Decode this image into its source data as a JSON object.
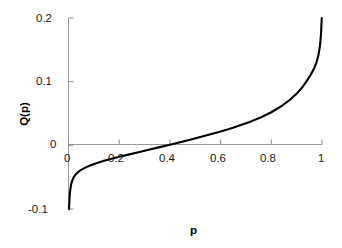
{
  "chart_data": {
    "type": "line",
    "title": "",
    "subtitle": "",
    "xlabel": "p",
    "ylabel": "Q(p)",
    "xlim": [
      0,
      1
    ],
    "ylim": [
      -0.1,
      0.2
    ],
    "grid": false,
    "legend": null,
    "x_ticks": [
      {
        "value": 0,
        "label": "0"
      },
      {
        "value": 0.2,
        "label": "0.2"
      },
      {
        "value": 0.4,
        "label": "0.4"
      },
      {
        "value": 0.6,
        "label": "0.6"
      },
      {
        "value": 0.8,
        "label": "0.8"
      },
      {
        "value": 1,
        "label": "1"
      }
    ],
    "y_ticks": [
      {
        "value": 0.2,
        "label": "0.2"
      },
      {
        "value": 0.1,
        "label": "0.1"
      },
      {
        "value": 0,
        "label": "0"
      },
      {
        "value": -0.1,
        "label": "-0.1"
      }
    ],
    "series": [
      {
        "name": "Q(p)",
        "color": "#000000",
        "x": [
          0.002,
          0.005,
          0.01,
          0.015,
          0.02,
          0.03,
          0.04,
          0.05,
          0.07,
          0.09,
          0.11,
          0.14,
          0.17,
          0.2,
          0.24,
          0.28,
          0.32,
          0.36,
          0.4,
          0.44,
          0.48,
          0.52,
          0.56,
          0.6,
          0.64,
          0.68,
          0.72,
          0.76,
          0.8,
          0.84,
          0.87,
          0.9,
          0.92,
          0.94,
          0.955,
          0.968,
          0.978,
          0.986,
          0.992,
          0.996,
          0.999
        ],
        "y": [
          -0.1,
          -0.076,
          -0.062,
          -0.055,
          -0.0505,
          -0.045,
          -0.0412,
          -0.0385,
          -0.0342,
          -0.0308,
          -0.028,
          -0.0243,
          -0.021,
          -0.018,
          -0.0142,
          -0.0104,
          -0.0066,
          -0.0028,
          0.001,
          0.0049,
          0.0089,
          0.013,
          0.0173,
          0.0218,
          0.0266,
          0.0318,
          0.0376,
          0.0442,
          0.052,
          0.0616,
          0.0704,
          0.0812,
          0.09,
          0.1012,
          0.1104,
          0.1202,
          0.13,
          0.142,
          0.156,
          0.174,
          0.2
        ]
      }
    ],
    "axis_colors": {
      "axis_line": "#999999",
      "curve": "#000000"
    }
  },
  "labels": {
    "y_0p2": "0.2",
    "y_0p1": "0.1",
    "y_0": "0",
    "y_neg0p1": "-0.1",
    "x_0": "0",
    "x_0p2": "0.2",
    "x_0p4": "0.4",
    "x_0p6": "0.6",
    "x_0p8": "0.8",
    "x_1": "1",
    "axis_y_title": "Q(p)",
    "axis_x_title": "p"
  }
}
